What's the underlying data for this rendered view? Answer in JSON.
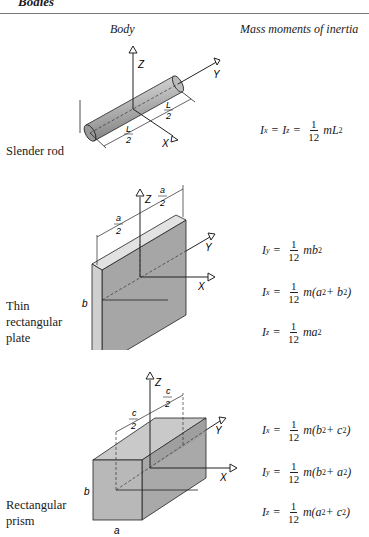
{
  "header": {
    "section_title": "Bodies",
    "col_body": "Body",
    "col_inertia": "Mass moments of inertia"
  },
  "rows": [
    {
      "body_label": "Slender rod",
      "diagram_labels": {
        "z": "Z",
        "y": "Y",
        "x": "X",
        "dim1_num": "L",
        "dim1_den": "2",
        "dim2_num": "L",
        "dim2_den": "2"
      },
      "formulas": [
        {
          "lhs": "I",
          "lhs_sub": "x",
          "lhs2": "I",
          "lhs2_sub": "z",
          "num": "1",
          "den": "12",
          "rest": "mL",
          "rest_sup": "2",
          "tail": ""
        }
      ]
    },
    {
      "body_label_lines": [
        "Thin",
        "rectangular",
        "plate"
      ],
      "diagram_labels": {
        "z": "Z",
        "y": "Y",
        "x": "X",
        "dim1_num": "a",
        "dim1_den": "2",
        "dim2_num": "a",
        "dim2_den": "2",
        "b": "b"
      },
      "formulas": [
        {
          "lhs": "I",
          "lhs_sub": "y",
          "num": "1",
          "den": "12",
          "rest": "mb",
          "rest_sup": "2",
          "tail": ""
        },
        {
          "lhs": "I",
          "lhs_sub": "x",
          "num": "1",
          "den": "12",
          "rest": "m(a",
          "rest_sup": "2",
          "mid": " + b",
          "mid_sup": "2",
          "tail": ")"
        },
        {
          "lhs": "I",
          "lhs_sub": "z",
          "num": "1",
          "den": "12",
          "rest": "ma",
          "rest_sup": "2",
          "tail": ""
        }
      ]
    },
    {
      "body_label_lines": [
        "Rectangular",
        "prism"
      ],
      "diagram_labels": {
        "z": "Z",
        "y": "Y",
        "x": "X",
        "dim1_num": "c",
        "dim1_den": "2",
        "dim2_num": "c",
        "dim2_den": "2",
        "b": "b",
        "a": "a"
      },
      "formulas": [
        {
          "lhs": "I",
          "lhs_sub": "x",
          "num": "1",
          "den": "12",
          "rest": "m(b",
          "rest_sup": "2",
          "mid": " + c",
          "mid_sup": "2",
          "tail": ")"
        },
        {
          "lhs": "I",
          "lhs_sub": "y",
          "num": "1",
          "den": "12",
          "rest": "m(b",
          "rest_sup": "2",
          "mid": " + a",
          "mid_sup": "2",
          "tail": ")"
        },
        {
          "lhs": "I",
          "lhs_sub": "z",
          "num": "1",
          "den": "12",
          "rest": "m(a",
          "rest_sup": "2",
          "mid": " + c",
          "mid_sup": "2",
          "tail": ")"
        }
      ]
    }
  ]
}
